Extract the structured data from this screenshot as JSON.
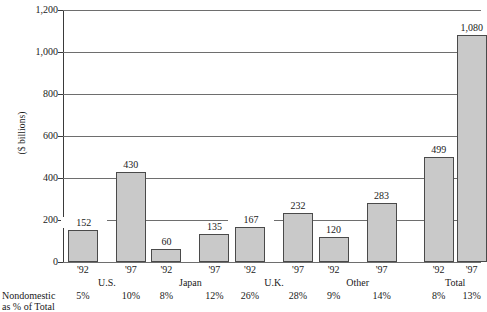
{
  "chart_data": {
    "type": "bar",
    "title": "",
    "xlabel": "",
    "ylabel": "($ billions)",
    "ylim": [
      0,
      1200
    ],
    "ytick_labels": [
      "0",
      "200",
      "400",
      "600",
      "800",
      "1,000",
      "1,200"
    ],
    "ytick_values": [
      0,
      200,
      400,
      600,
      800,
      1000,
      1200
    ],
    "grid": true,
    "legend": "none",
    "categories": [
      "U.S.",
      "Japan",
      "U.K.",
      "Other",
      "Total"
    ],
    "series": [
      {
        "name": "'92",
        "values": [
          152,
          60,
          167,
          120,
          499
        ]
      },
      {
        "name": "'97",
        "values": [
          430,
          135,
          232,
          283,
          1080
        ]
      }
    ],
    "data_labels": {
      "'92": [
        "152",
        "60",
        "167",
        "120",
        "499"
      ],
      "'97": [
        "430",
        "135",
        "232",
        "283",
        "1,080"
      ]
    },
    "secondary_row": {
      "label_line1": "Nondomestic",
      "label_line2": "as % of Total",
      "series": [
        {
          "name": "'92",
          "values": [
            "5%",
            "8%",
            "26%",
            "9%",
            "8%"
          ]
        },
        {
          "name": "'97",
          "values": [
            "10%",
            "12%",
            "28%",
            "14%",
            "13%"
          ]
        }
      ]
    },
    "colors": {
      "bar_fill": "#c9c9c9",
      "bar_stroke": "#4a4a4a",
      "gridline": "#6e6e6e",
      "axis": "#3a3a3a",
      "text": "#1a1a1a",
      "background": "#ffffff"
    }
  }
}
